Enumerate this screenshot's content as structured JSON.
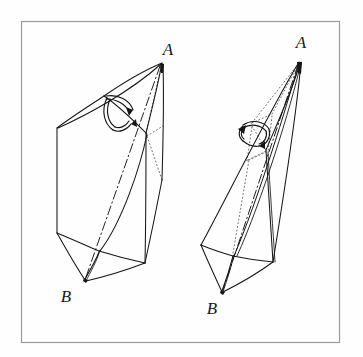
{
  "figure": {
    "background_color": "#fefefe",
    "frame": {
      "name": "border-frame",
      "x": 21,
      "y": 21,
      "width": 319,
      "height": 322,
      "stroke": "#9a9a9a",
      "stroke_width": 1.2
    },
    "ink_color": "#161616",
    "hidden_edge_color": "#5a5a5a",
    "panels": [
      {
        "id": "left-panel",
        "name": "left-figure",
        "caption": "Unflattened bipyramid",
        "apex_top_label": "A",
        "apex_bottom_label": "B",
        "apex_top_label_pos": {
          "x": 168,
          "y": 55
        },
        "apex_bottom_label_pos": {
          "x": 66,
          "y": 302
        },
        "vertices": {
          "A": {
            "x": 162,
            "y": 63
          },
          "B": {
            "x": 85,
            "y": 280
          },
          "topLeft": {
            "x": 104,
            "y": 96
          },
          "left": {
            "x": 57,
            "y": 128
          },
          "right": {
            "x": 162,
            "y": 180
          },
          "midRight": {
            "x": 146,
            "y": 133
          },
          "botLeft": {
            "x": 57,
            "y": 233
          },
          "botMid": {
            "x": 99,
            "y": 251
          },
          "botRight": {
            "x": 145,
            "y": 263
          }
        },
        "rotation_arrow": {
          "name": "rotation-arrow-left",
          "center": {
            "x": 120,
            "y": 105
          },
          "description": "curved double-headed arrow indicating rotation/folding"
        }
      },
      {
        "id": "right-panel",
        "name": "right-figure",
        "caption": "Flattened bipyramid",
        "apex_top_label": "A",
        "apex_bottom_label": "B",
        "apex_top_label_pos": {
          "x": 301,
          "y": 48
        },
        "apex_bottom_label_pos": {
          "x": 212,
          "y": 314
        },
        "vertices": {
          "A": {
            "x": 300,
            "y": 61
          },
          "B": {
            "x": 222,
            "y": 293
          },
          "left": {
            "x": 201,
            "y": 245
          },
          "right": {
            "x": 273,
            "y": 262
          },
          "midFront": {
            "x": 266,
            "y": 150
          },
          "botMid": {
            "x": 233,
            "y": 256
          }
        },
        "rotation_arrow": {
          "name": "rotation-arrow-right",
          "center": {
            "x": 258,
            "y": 133
          },
          "description": "curved double-headed arrow indicating rotation/folding"
        }
      }
    ],
    "labels": [
      {
        "text": "A",
        "panel": "left"
      },
      {
        "text": "B",
        "panel": "left"
      },
      {
        "text": "A",
        "panel": "right"
      },
      {
        "text": "B",
        "panel": "right"
      }
    ]
  }
}
